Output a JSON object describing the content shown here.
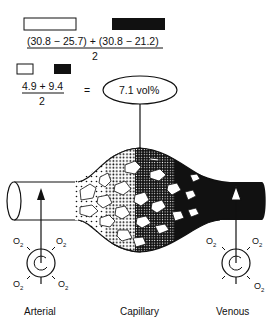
{
  "equation1": {
    "legend_open_box": "arterial",
    "legend_filled_box": "venous",
    "numerator": "(30.8 − 25.7) + (30.8 − 21.2)",
    "denominator": "2"
  },
  "equation2": {
    "numerator": "4.9 + 9.4",
    "denominator": "2",
    "equals": "=",
    "result": "7.1 vol%"
  },
  "labels": {
    "arterial": "Arterial",
    "capillary": "Capillary",
    "venous": "Venous"
  },
  "oxygen": {
    "symbol": "O",
    "subscript": "2"
  },
  "colors": {
    "ink": "#111111",
    "background": "#ffffff"
  }
}
